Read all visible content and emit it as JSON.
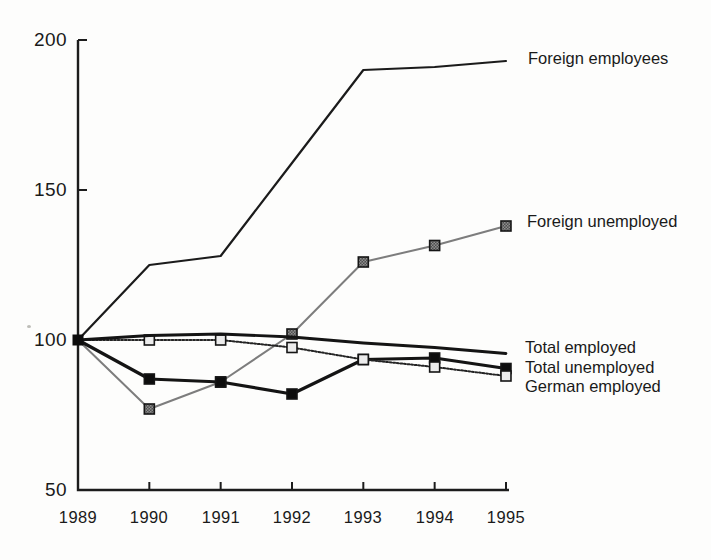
{
  "chart_data": {
    "type": "line",
    "x": [
      1989,
      1990,
      1991,
      1992,
      1993,
      1994,
      1995
    ],
    "x_tick_labels": [
      "1989",
      "1990",
      "1991",
      "1992",
      "1993",
      "1994",
      "1995"
    ],
    "ylim": [
      50,
      200
    ],
    "yticks": [
      50,
      100,
      150,
      200
    ],
    "y_tick_labels_top_to_bottom": [
      "200",
      "150",
      "100",
      "50"
    ],
    "axis_color": "#1c1c1c",
    "marker_pattern": {
      "dark": "#4e4e4e",
      "light": "#8f8f8f"
    },
    "series": [
      {
        "name": "Foreign employees",
        "values": [
          100,
          125,
          128,
          159,
          190,
          191,
          193
        ],
        "color": "#1b1b1b",
        "width": 2.2,
        "marker": "none"
      },
      {
        "name": "Foreign unemployed",
        "values": [
          100,
          77,
          86,
          102,
          126,
          131.5,
          138
        ],
        "color": "#7d7d7d",
        "width": 2,
        "marker": "checkered-square"
      },
      {
        "name": "Total employed",
        "values": [
          100,
          101.5,
          102,
          101,
          99,
          97.5,
          95.5
        ],
        "color": "#141414",
        "width": 2.8,
        "marker": "none"
      },
      {
        "name": "Total unemployed",
        "values": [
          100,
          87,
          86,
          82,
          93.5,
          94,
          90.5
        ],
        "color": "#141414",
        "width": 3.2,
        "marker": "filled-square",
        "marker_fill": "#0d0d0d"
      },
      {
        "name": "German employed",
        "values": [
          100,
          100,
          100,
          97.5,
          93.5,
          91,
          88
        ],
        "color": "#242424",
        "width": 2,
        "marker": "open-square",
        "marker_fill": "#ececec",
        "dash": "1.8 1.8"
      }
    ],
    "start_marker": {
      "shape": "filled-square",
      "color": "#0d0d0d"
    },
    "legend_position": "right-inline"
  }
}
